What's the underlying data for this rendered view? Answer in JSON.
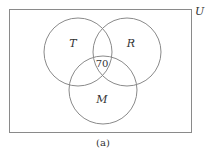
{
  "diagram": {
    "type": "venn",
    "universe_label": "U",
    "sets": [
      {
        "id": "T",
        "label": "T"
      },
      {
        "id": "R",
        "label": "R"
      },
      {
        "id": "M",
        "label": "M"
      }
    ],
    "regions": [
      {
        "sets": [
          "T",
          "R",
          "M"
        ],
        "value": "70"
      }
    ],
    "caption": "(a)",
    "line_color": "#888888"
  }
}
